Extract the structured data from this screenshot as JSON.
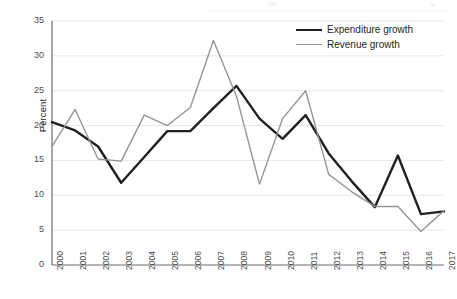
{
  "chart_data": {
    "type": "line",
    "title": "",
    "xlabel": "",
    "ylabel": "Percent",
    "ylim": [
      0,
      35
    ],
    "ytick_step": 5,
    "yticks": [
      0,
      5,
      10,
      15,
      20,
      25,
      30,
      35
    ],
    "grid": true,
    "legend_position": "top-right",
    "categories": [
      "2000",
      "2001",
      "2002",
      "2003",
      "2004",
      "2005",
      "2006",
      "2007",
      "2008",
      "2009",
      "2010",
      "2011",
      "2012",
      "2013",
      "2014",
      "2015",
      "2016",
      "2017"
    ],
    "series": [
      {
        "name": "Expenditure growth",
        "color": "#231f20",
        "values": [
          20.5,
          19.3,
          17.0,
          11.8,
          15.5,
          19.2,
          19.2,
          22.5,
          25.7,
          21.0,
          18.1,
          21.5,
          16.0,
          12.0,
          8.3,
          15.7,
          7.3,
          7.7
        ]
      },
      {
        "name": "Revenue growth",
        "color": "#939598",
        "values": [
          17.0,
          22.3,
          15.2,
          14.9,
          21.5,
          20.0,
          22.6,
          32.2,
          24.2,
          11.6,
          21.0,
          25.0,
          13.0,
          10.5,
          8.4,
          8.4,
          4.8,
          7.8
        ]
      }
    ]
  },
  "axis": {
    "y_title": "Percent"
  },
  "legend": {
    "items": [
      {
        "label": "Expenditure growth"
      },
      {
        "label": "Revenue growth"
      }
    ]
  }
}
